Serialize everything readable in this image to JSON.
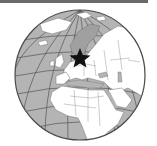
{
  "map": {
    "type": "orthographic-globe-locator",
    "caption": "Location of Denmark / Baltic region on globe",
    "marker": {
      "icon": "star-icon",
      "region": "Northern Europe (Baltic / Scandinavia)",
      "color": "#111111"
    },
    "colors": {
      "ocean": "#b4b4b4",
      "land": "#ffffff",
      "highlight_land": "#a0a0a0",
      "graticule": "#555555",
      "border": "#707070",
      "rim": "#4a4a4a",
      "topbar": "#6a6a6a"
    },
    "visible_regions": [
      "Greenland",
      "Scandinavia",
      "Europe",
      "Russia",
      "North Africa",
      "Middle East",
      "Arabian Peninsula",
      "Atlantic Ocean",
      "Indian Ocean"
    ]
  }
}
